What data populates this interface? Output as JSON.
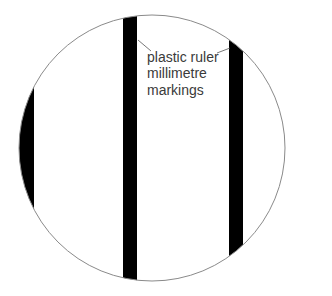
{
  "diagram": {
    "type": "magnified-view",
    "lens": {
      "cx": 152,
      "cy": 148,
      "r": 133,
      "stroke": "#8a8a8a"
    },
    "markings": [
      {
        "id": "left",
        "x": 19,
        "width": 15
      },
      {
        "id": "center",
        "x": 123,
        "width": 14
      },
      {
        "id": "right",
        "x": 229,
        "width": 14
      }
    ],
    "marking_color": "#000000",
    "label": {
      "lines": [
        "plastic ruler",
        "millimetre",
        "markings"
      ]
    }
  }
}
